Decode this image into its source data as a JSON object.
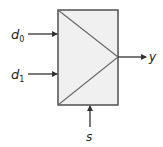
{
  "diagram": {
    "type": "multiplexer",
    "colors": {
      "stroke": "#444444",
      "box_fill": "#f0f0f0",
      "triangle_stroke": "#666666",
      "text": "#222222"
    },
    "inputs": [
      {
        "name": "d",
        "subscript": "0",
        "side": "left"
      },
      {
        "name": "d",
        "subscript": "1",
        "side": "left"
      }
    ],
    "select": {
      "name": "s",
      "side": "bottom"
    },
    "output": {
      "name": "y",
      "side": "right"
    }
  }
}
